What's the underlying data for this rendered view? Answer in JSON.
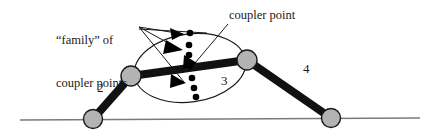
{
  "figure": {
    "type": "mechanism-diagram"
  },
  "annotations": {
    "family_line1": "“family” of",
    "family_line2": "coupler points",
    "coupler_point": "coupler point"
  },
  "link_labels": {
    "crank": "2",
    "coupler": "3",
    "rocker": "4"
  },
  "colors": {
    "link_fill": "#111111",
    "joint_fill": "#b3b3b3",
    "joint_stroke": "#1a1a1a",
    "ground_line": "#7a7a7a",
    "ellipse_stroke": "#1a1a1a",
    "leader_line": "#1a1a1a",
    "point_fill": "#000000",
    "text": "#1a1a1a",
    "background": "#ffffff"
  },
  "geometry": {
    "ground_line": {
      "x1": 20,
      "y1": 120,
      "x2": 420,
      "y2": 118
    },
    "joints": [
      {
        "name": "ground-pivot-left",
        "cx": 93,
        "cy": 119,
        "r": 9.5
      },
      {
        "name": "crank-coupler-joint",
        "cx": 131,
        "cy": 76,
        "r": 10
      },
      {
        "name": "coupler-rocker-joint",
        "cx": 247,
        "cy": 60,
        "r": 10
      },
      {
        "name": "ground-pivot-right",
        "cx": 331,
        "cy": 118,
        "r": 9.5
      }
    ],
    "links": [
      {
        "name": "crank-link-2",
        "x1": 93,
        "y1": 119,
        "x2": 131,
        "y2": 76,
        "width": 8
      },
      {
        "name": "coupler-link-3",
        "x1": 131,
        "y1": 76,
        "x2": 247,
        "y2": 60,
        "width": 8
      },
      {
        "name": "rocker-link-4",
        "x1": 247,
        "y1": 60,
        "x2": 331,
        "y2": 118,
        "width": 8
      }
    ],
    "coupler_ellipse": {
      "cx": 190,
      "cy": 68,
      "rx": 56,
      "ry": 34,
      "rotation": -8
    },
    "coupler_points": [
      {
        "cx": 190,
        "cy": 33
      },
      {
        "cx": 189,
        "cy": 45
      },
      {
        "cx": 189,
        "cy": 55
      },
      {
        "cx": 190,
        "cy": 66
      },
      {
        "cx": 192,
        "cy": 78
      },
      {
        "cx": 194,
        "cy": 88
      },
      {
        "cx": 196,
        "cy": 97
      }
    ],
    "arrowheads": [
      {
        "name": "arrowhead-1",
        "tipx": 184,
        "tipy": 34,
        "angle": 5
      },
      {
        "name": "arrowhead-2",
        "tipx": 183,
        "tipy": 50,
        "angle": 20
      },
      {
        "name": "arrowhead-3",
        "tipx": 196,
        "tipy": 62,
        "angle": 30
      },
      {
        "name": "arrowhead-4",
        "tipx": 186,
        "tipy": 82,
        "angle": 55
      }
    ],
    "leader_lines": [
      {
        "name": "leader-family-1",
        "x1": 139,
        "y1": 27,
        "x2": 182,
        "y2": 34
      },
      {
        "name": "leader-family-2",
        "x1": 139,
        "y1": 27,
        "x2": 181,
        "y2": 50
      },
      {
        "name": "leader-family-3",
        "x1": 139,
        "y1": 27,
        "x2": 184,
        "y2": 82
      },
      {
        "name": "leader-family-4",
        "x1": 139,
        "y1": 29,
        "x2": 206,
        "y2": 33
      },
      {
        "name": "leader-coupler-point",
        "x1": 228,
        "y1": 24,
        "x2": 194,
        "y2": 63
      }
    ]
  }
}
